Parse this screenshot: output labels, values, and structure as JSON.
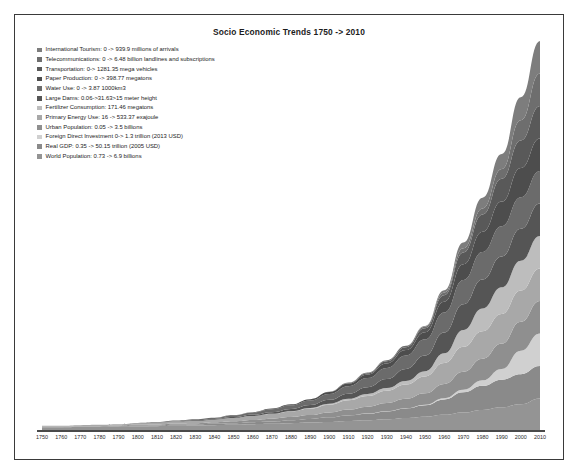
{
  "chart_data": {
    "type": "area",
    "title": "Socio Economic Trends 1750 -> 2010",
    "xlabel": "",
    "ylabel": "",
    "grid": false,
    "legend_position": "top-left",
    "stacked": true,
    "x": [
      1750,
      1760,
      1770,
      1780,
      1790,
      1800,
      1810,
      1820,
      1830,
      1840,
      1850,
      1860,
      1870,
      1880,
      1890,
      1900,
      1910,
      1920,
      1930,
      1940,
      1950,
      1960,
      1970,
      1980,
      1990,
      2000,
      2010
    ],
    "xlim": [
      1750,
      2010
    ],
    "xtick_labels": [
      "1750",
      "1760",
      "1770",
      "1780",
      "1790",
      "1800",
      "1810",
      "1820",
      "1830",
      "1840",
      "1850",
      "1860",
      "1870",
      "1880",
      "1890",
      "1900",
      "1910",
      "1920",
      "1930",
      "1940",
      "1950",
      "1960",
      "1970",
      "1980",
      "1990",
      "2000",
      "2010"
    ],
    "series": [
      {
        "name": "International Tourism",
        "legend_label": "International Tourism: 0 -> 939.9 millions of arrivals",
        "color": "#7d7d7d",
        "start_value": 0,
        "end_value": 939.9,
        "unit": "millions of arrivals",
        "values": [
          0,
          0,
          0,
          0,
          0,
          0,
          0,
          0,
          0,
          0,
          0,
          0,
          0,
          0,
          0,
          0,
          0,
          0,
          0,
          0,
          2,
          7,
          18,
          33,
          46,
          71,
          100
        ]
      },
      {
        "name": "Telecommunications",
        "legend_label": "Telecommunications: 0 -> 6.48 billion landlines and subscriptions",
        "color": "#6e6e6e",
        "start_value": 0,
        "end_value": 6.48,
        "unit": "billion landlines and subscriptions",
        "values": [
          0,
          0,
          0,
          0,
          0,
          0,
          0,
          0,
          0,
          0,
          0,
          0,
          0,
          0,
          0,
          0,
          1,
          2,
          3,
          4,
          5,
          8,
          13,
          19,
          30,
          62,
          100
        ]
      },
      {
        "name": "Transportation",
        "legend_label": "Transportation: 0-> 1281.35 mega vehicles",
        "color": "#595959",
        "start_value": 0,
        "end_value": 1281.35,
        "unit": "mega vehicles",
        "values": [
          0,
          0,
          0,
          0,
          0,
          0,
          0,
          0,
          0,
          0,
          0,
          0,
          0,
          0,
          0,
          1,
          2,
          4,
          7,
          9,
          12,
          20,
          36,
          53,
          70,
          85,
          100
        ]
      },
      {
        "name": "Paper Production",
        "legend_label": "Paper Production: 0 -> 398.77 megatons",
        "color": "#4d4d4d",
        "start_value": 0,
        "end_value": 398.77,
        "unit": "megatons",
        "values": [
          0,
          0,
          0,
          0,
          0,
          0,
          0,
          0,
          0,
          0,
          1,
          1,
          2,
          3,
          4,
          6,
          8,
          11,
          14,
          17,
          22,
          33,
          48,
          62,
          76,
          90,
          100
        ]
      },
      {
        "name": "Water Use",
        "legend_label": "Water Use: 0 -> 3.87 1000km3",
        "color": "#6b6b6b",
        "start_value": 0,
        "end_value": 3.87,
        "unit": "1000km3",
        "values": [
          0,
          0,
          0,
          0,
          0,
          1,
          1,
          2,
          3,
          4,
          5,
          7,
          9,
          11,
          14,
          18,
          23,
          28,
          34,
          41,
          50,
          62,
          75,
          85,
          93,
          97,
          100
        ]
      },
      {
        "name": "Large Dams",
        "legend_label": "Large Dams: 0.06->31.63>15 meter height",
        "color": "#555555",
        "start_value": 0.06,
        "end_value": 31.63,
        "unit": ">15 meter height",
        "values": [
          0,
          0,
          0,
          0,
          0,
          0,
          1,
          1,
          2,
          2,
          3,
          4,
          5,
          7,
          9,
          12,
          16,
          21,
          28,
          37,
          48,
          64,
          79,
          89,
          95,
          98,
          100
        ]
      },
      {
        "name": "Fertilizer Consumption",
        "legend_label": "Fertilizer Consumption: 171.46 megatons",
        "color": "#bdbdbd",
        "start_value": 0,
        "end_value": 171.46,
        "unit": "megatons",
        "values": [
          0,
          0,
          0,
          0,
          0,
          0,
          0,
          0,
          0,
          0,
          0,
          0,
          1,
          1,
          2,
          3,
          4,
          6,
          8,
          11,
          16,
          30,
          52,
          70,
          82,
          92,
          100
        ]
      },
      {
        "name": "Primary Energy Use",
        "legend_label": "Primary Energy Use: 16 -> 533.37 exajoule",
        "color": "#a8a8a8",
        "start_value": 16,
        "end_value": 533.37,
        "unit": "exajoule",
        "values": [
          3,
          3,
          3,
          4,
          4,
          5,
          5,
          6,
          7,
          8,
          10,
          12,
          14,
          17,
          20,
          24,
          29,
          33,
          38,
          44,
          52,
          64,
          77,
          85,
          91,
          96,
          100
        ]
      },
      {
        "name": "Urban Population",
        "legend_label": "Urban Population: 0.05 -> 3.5 billions",
        "color": "#8f8f8f",
        "start_value": 0.05,
        "end_value": 3.5,
        "unit": "billions",
        "values": [
          1,
          1,
          2,
          2,
          2,
          3,
          3,
          4,
          4,
          5,
          6,
          7,
          9,
          10,
          12,
          15,
          18,
          21,
          25,
          29,
          35,
          44,
          55,
          66,
          78,
          89,
          100
        ]
      },
      {
        "name": "Foreign Direct Investment",
        "legend_label": "Foreign Direct Investment 0-> 1.3 trillion (2013 USD)",
        "color": "#d0d0d0",
        "start_value": 0,
        "end_value": 1.3,
        "unit": "trillion (2013 USD)",
        "values": [
          0,
          0,
          0,
          0,
          0,
          0,
          0,
          0,
          0,
          0,
          0,
          0,
          0,
          0,
          0,
          0,
          0,
          1,
          1,
          1,
          2,
          4,
          8,
          17,
          33,
          72,
          100
        ]
      },
      {
        "name": "Real GDP",
        "legend_label": "Real GDP: 0.35 -> 50.15 trillion (2005 USD)",
        "color": "#8a8a8a",
        "start_value": 0.35,
        "end_value": 50.15,
        "unit": "trillion (2005 USD)",
        "values": [
          1,
          1,
          1,
          1,
          2,
          2,
          2,
          3,
          3,
          4,
          5,
          6,
          7,
          9,
          11,
          14,
          17,
          20,
          24,
          29,
          35,
          47,
          62,
          74,
          85,
          93,
          100
        ]
      },
      {
        "name": "World Population",
        "legend_label": "World Population: 0.73 -> 6.9 billions",
        "color": "#949494",
        "start_value": 0.73,
        "end_value": 6.9,
        "unit": "billions",
        "values": [
          11,
          11,
          12,
          12,
          13,
          14,
          15,
          16,
          17,
          18,
          19,
          21,
          22,
          24,
          26,
          28,
          31,
          33,
          36,
          40,
          44,
          50,
          57,
          65,
          73,
          82,
          100
        ]
      }
    ]
  },
  "frame": {
    "border_color": "#3a3a3a",
    "background": "#ffffff"
  },
  "axis": {
    "line_color": "#4a4a4a"
  }
}
